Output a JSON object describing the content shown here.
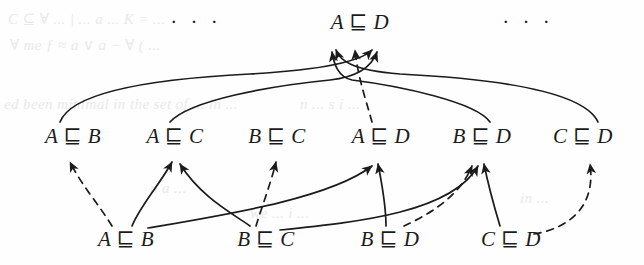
{
  "figure": {
    "type": "derivation-diagram",
    "background_color": "#fefefe",
    "ink_color": "#1b1b1b",
    "operator": "⊑"
  },
  "rows": {
    "top": {
      "label": "goal-row",
      "left_ellipsis": "· · ·",
      "right_ellipsis": "· · ·",
      "nodes": [
        {
          "id": "t-AD",
          "left": "A",
          "op": "⊑",
          "right": "D",
          "text": "A ⊑ D",
          "x": 360,
          "y": 22
        }
      ]
    },
    "middle": {
      "label": "middle-row",
      "nodes": [
        {
          "id": "m-AB",
          "left": "A",
          "op": "⊑",
          "right": "B",
          "text": "A ⊑ B",
          "x": 73,
          "y": 136
        },
        {
          "id": "m-AC",
          "left": "A",
          "op": "⊑",
          "right": "C",
          "text": "A ⊑ C",
          "x": 175,
          "y": 136
        },
        {
          "id": "m-BC",
          "left": "B",
          "op": "⊑",
          "right": "C",
          "text": "B ⊑ C",
          "x": 277,
          "y": 136
        },
        {
          "id": "m-AD",
          "left": "A",
          "op": "⊑",
          "right": "D",
          "text": "A ⊑ D",
          "x": 381,
          "y": 136
        },
        {
          "id": "m-BD",
          "left": "B",
          "op": "⊑",
          "right": "D",
          "text": "B ⊑ D",
          "x": 482,
          "y": 136
        },
        {
          "id": "m-CD",
          "left": "C",
          "op": "⊑",
          "right": "D",
          "text": "C ⊑ D",
          "x": 583,
          "y": 136
        }
      ]
    },
    "bottom": {
      "label": "premise-row",
      "nodes": [
        {
          "id": "b-AB",
          "left": "A",
          "op": "⊑",
          "right": "B",
          "text": "A ⊑ B",
          "x": 126,
          "y": 239
        },
        {
          "id": "b-BC",
          "left": "B",
          "op": "⊑",
          "right": "C",
          "text": "B ⊑ C",
          "x": 266,
          "y": 239
        },
        {
          "id": "b-BD",
          "left": "B",
          "op": "⊑",
          "right": "D",
          "text": "B ⊑ D",
          "x": 390,
          "y": 239
        },
        {
          "id": "b-CD",
          "left": "C",
          "op": "⊑",
          "right": "D",
          "text": "C ⊑ D",
          "x": 511,
          "y": 239
        }
      ]
    }
  },
  "edges": {
    "solid_label": "solid-arrow",
    "dashed_label": "dashed-arrow",
    "to_top": [
      {
        "from": "m-AB",
        "to": "t-AD",
        "style": "solid"
      },
      {
        "from": "m-AC",
        "to": "t-AD",
        "style": "solid"
      },
      {
        "from": "m-AD",
        "to": "t-AD",
        "style": "dashed"
      },
      {
        "from": "m-BD",
        "to": "t-AD",
        "style": "solid"
      },
      {
        "from": "m-CD",
        "to": "t-AD",
        "style": "solid"
      }
    ],
    "to_middle": [
      {
        "from": "b-AB",
        "to": "m-AB",
        "style": "dashed"
      },
      {
        "from": "b-AB",
        "to": "m-AC",
        "style": "solid"
      },
      {
        "from": "b-BC",
        "to": "m-AC",
        "style": "solid"
      },
      {
        "from": "b-BC",
        "to": "m-BC",
        "style": "dashed"
      },
      {
        "from": "b-AB",
        "to": "m-AD",
        "style": "solid"
      },
      {
        "from": "b-BD",
        "to": "m-AD",
        "style": "solid"
      },
      {
        "from": "b-BD",
        "to": "m-BD",
        "style": "dashed"
      },
      {
        "from": "b-BC",
        "to": "m-BD",
        "style": "solid"
      },
      {
        "from": "b-CD",
        "to": "m-BD",
        "style": "solid"
      },
      {
        "from": "b-CD",
        "to": "m-CD",
        "style": "dashed"
      }
    ]
  },
  "ghost_text": [
    {
      "text": "C ⊆ ∀ ... | ... a ... K = ...",
      "x": 8,
      "y": 10
    },
    {
      "text": "∀ me ƒ ≈ a ∨ a − ∀ ( ...",
      "x": 10,
      "y": 36
    },
    {
      "text": "ed been minimal in the set of ... in ...",
      "x": 4,
      "y": 96
    },
    {
      "text": "n ... s i ...",
      "x": 300,
      "y": 96
    },
    {
      "text": "n a ...",
      "x": 150,
      "y": 180
    },
    {
      "text": "we ... i ...",
      "x": 250,
      "y": 205
    },
    {
      "text": "in ...",
      "x": 520,
      "y": 190
    }
  ]
}
